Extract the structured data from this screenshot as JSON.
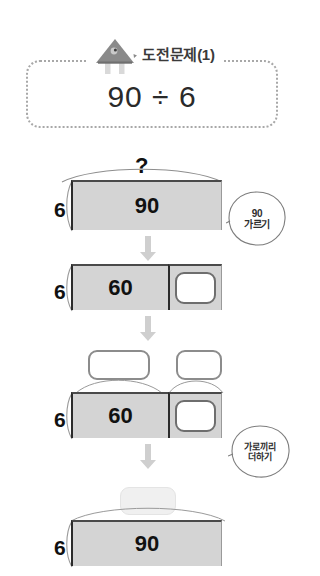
{
  "header": {
    "icon": "house-bird-icon",
    "title": "도전문제(1)",
    "expression": "90 ÷ 6"
  },
  "steps": [
    {
      "id": "step-1",
      "divisor": "6",
      "brace_label": "?",
      "segments": [
        {
          "value": "90",
          "type": "filled"
        }
      ],
      "top_boxes": []
    },
    {
      "id": "step-2",
      "divisor": "6",
      "brace_label": "",
      "segments": [
        {
          "value": "60",
          "type": "filled"
        },
        {
          "value": "",
          "type": "blank-inner"
        }
      ],
      "top_boxes": []
    },
    {
      "id": "step-3",
      "divisor": "6",
      "brace_label": "",
      "segments": [
        {
          "value": "60",
          "type": "filled"
        },
        {
          "value": "",
          "type": "blank-inner"
        }
      ],
      "top_boxes": [
        {
          "value": "",
          "style": "outlined"
        },
        {
          "value": "",
          "style": "outlined"
        }
      ]
    },
    {
      "id": "step-4",
      "divisor": "6",
      "brace_label": "",
      "segments": [
        {
          "value": "90",
          "type": "filled"
        }
      ],
      "top_boxes": [
        {
          "value": "",
          "style": "faint"
        }
      ]
    }
  ],
  "notes": [
    {
      "id": "note-split",
      "line1": "90",
      "line2": "가르기"
    },
    {
      "id": "note-add",
      "line1": "가로끼리",
      "line2": "더하기"
    }
  ],
  "arrows": [
    {
      "id": "arrow-1"
    },
    {
      "id": "arrow-2"
    },
    {
      "id": "arrow-3"
    }
  ],
  "colors": {
    "bar_fill": "#d4d4d4",
    "bar_border_top": "#4a4a4a",
    "bar_border_left": "#2b2b2b",
    "card_border": "#a8a8a8",
    "arrow": "#cfcfcf",
    "text": "#111111",
    "title_text": "#3a3a3a"
  }
}
